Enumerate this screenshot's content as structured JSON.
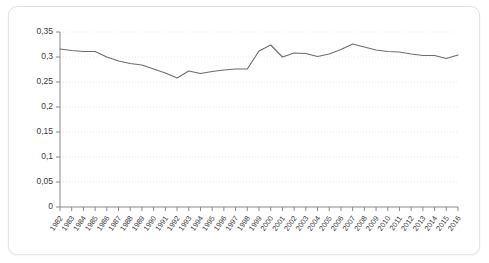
{
  "chart_data": {
    "type": "line",
    "title": "",
    "subtitle": "",
    "xlabel": "",
    "ylabel": "",
    "ylim": [
      0,
      0.35
    ],
    "ytick_labels": [
      "0",
      "0,05",
      "0,1",
      "0,15",
      "0,2",
      "0,25",
      "0,3",
      "0,35"
    ],
    "ytick_values": [
      0,
      0.05,
      0.1,
      0.15,
      0.2,
      0.25,
      0.3,
      0.35
    ],
    "grid": true,
    "legend": false,
    "decimal_separator": ",",
    "categories": [
      "1982",
      "1983",
      "1984",
      "1985",
      "1986",
      "1987",
      "1988",
      "1989",
      "1990",
      "1991",
      "1992",
      "1993",
      "1994",
      "1995",
      "1996",
      "1997",
      "1998",
      "1999",
      "2000",
      "2001",
      "2002",
      "2003",
      "2004",
      "2005",
      "2006",
      "2007",
      "2008",
      "2009",
      "2010",
      "2011",
      "2012",
      "2013",
      "2014",
      "2015",
      "2016"
    ],
    "series": [
      {
        "name": "series-1",
        "color": "#6e6e6e",
        "values": [
          0.316,
          0.313,
          0.311,
          0.311,
          0.3,
          0.292,
          0.287,
          0.284,
          0.276,
          0.268,
          0.258,
          0.272,
          0.267,
          0.271,
          0.274,
          0.276,
          0.276,
          0.312,
          0.324,
          0.3,
          0.308,
          0.307,
          0.301,
          0.306,
          0.315,
          0.326,
          0.32,
          0.314,
          0.311,
          0.31,
          0.306,
          0.303,
          0.303,
          0.297,
          0.304
        ]
      }
    ]
  },
  "axes": {
    "y_axis_name": "y-axis",
    "x_axis_name": "x-axis"
  }
}
